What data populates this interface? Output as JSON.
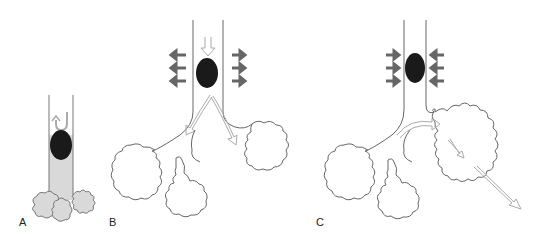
{
  "figure": {
    "panels": [
      {
        "id": "A",
        "label": "A",
        "description": "Valve obstructing airway; air trapped distal, lobes collapsed and shaded",
        "lobe_fill": "#d9d9d9"
      },
      {
        "id": "B",
        "label": "B",
        "description": "Inspiration: airway widens (outward arrows), air passes obstruction into distal lobes"
      },
      {
        "id": "C",
        "label": "C",
        "description": "Expiration: airway narrows (inward arrows), air trapped causing overdistended lobe"
      }
    ],
    "colors": {
      "outline": "#555555",
      "obstruction": "#1a1a1a",
      "pressure_arrow": "#666666",
      "airflow_arrow": "#aaaaaa",
      "shaded_fill": "#d9d9d9"
    }
  }
}
